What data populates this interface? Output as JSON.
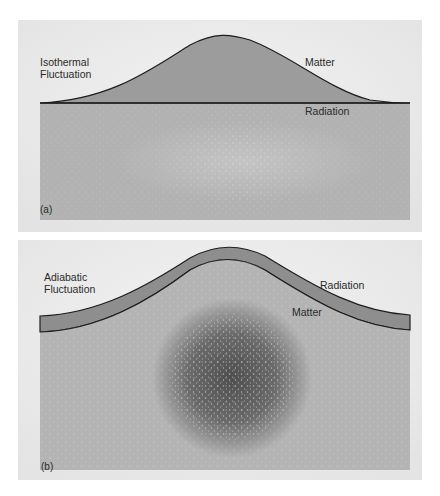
{
  "panel_a": {
    "title_label": "Isothermal\nFluctuation",
    "curve_label": "Matter",
    "line_label": "Radiation",
    "tag": "(a)"
  },
  "panel_b": {
    "title_label": "Adiabatic\nFluctuation",
    "outer_label": "Radiation",
    "inner_label": "Matter",
    "tag": "(b)"
  },
  "colors": {
    "frame": "#e9e9e9",
    "box": "#b3b3b3",
    "bump": "#9a9a9a",
    "band": "#8c8c8c",
    "blob": "#5a5a5a",
    "line": "#1e1e1e"
  }
}
